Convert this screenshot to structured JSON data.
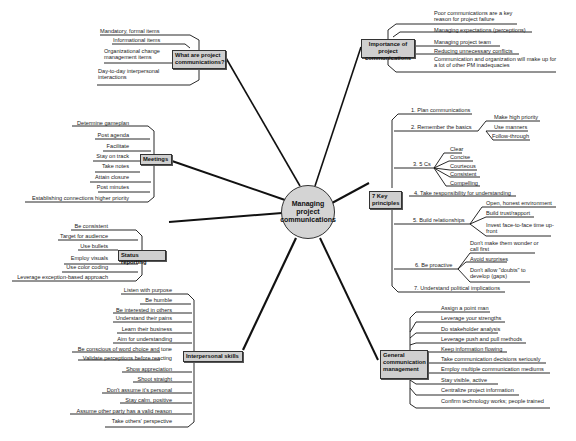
{
  "title": "Managing project communications",
  "colors": {
    "node_fill": "#cfcfcf",
    "center_fill": "#d4d4d4",
    "line": "#111111",
    "background": "#ffffff"
  },
  "branches": {
    "what": {
      "label": "What are project communications?",
      "items": [
        "Mandatory, formal items",
        "Informational items",
        "Organizational change management items",
        "Day-to-day interpersonal interactions"
      ]
    },
    "importance": {
      "label": "Importance of project communications",
      "items": [
        "Poor communications are a key reason for project failure",
        "Managing expectations (perceptions)",
        "Managing project team",
        "Reducing unnecessary conflicts",
        "Communication and organization will make up for a lot of other PM inadequacies"
      ]
    },
    "meetings": {
      "label": "Meetings",
      "items": [
        "Determine gameplan",
        "Post agenda",
        "Facilitate",
        "Stay on track",
        "Take notes",
        "Attain closure",
        "Post minutes",
        "Establishing connections higher priority"
      ]
    },
    "status": {
      "label": "Status reporting",
      "items": [
        "Be consistent",
        "Target for audience",
        "Use bullets",
        "Employ visuals",
        "Use color coding",
        "Leverage exception-based approach"
      ]
    },
    "interpersonal": {
      "label": "Interpersonal skills",
      "items": [
        "Listen with purpose",
        "Be humble",
        "Be interested in others",
        "Understand their pains",
        "Learn their business",
        "Aim for understanding",
        "Be conscious of word choice and tone",
        "Validate perceptions before reacting",
        "Show appreciation",
        "Shoot straight",
        "Don't assume it's personal",
        "Stay calm, positive",
        "Assume other party has a valid reason",
        "Take others' perspective"
      ]
    },
    "principles": {
      "label": "7 Key principles",
      "items": [
        {
          "label": "1. Plan communications",
          "children": []
        },
        {
          "label": "2. Remember the basics",
          "children": [
            "Make high priority",
            "Use manners",
            "Follow-through"
          ]
        },
        {
          "label": "3. 5 Cs",
          "children": [
            "Clear",
            "Concise",
            "Courteous",
            "Consistent",
            "Compelling"
          ]
        },
        {
          "label": "4. Take responsibility for understanding",
          "children": []
        },
        {
          "label": "5. Build relationships",
          "children": [
            "Open, honest environment",
            "Build trust/rapport",
            "Invest face-to-face time up-front"
          ]
        },
        {
          "label": "6. Be proactive",
          "children": [
            "Don't make them wonder or call first",
            "Avoid surprises",
            "Don't allow \"doubts\" to develop (gaps)"
          ]
        },
        {
          "label": "7. Understand political implications",
          "children": []
        }
      ]
    },
    "general": {
      "label": "General communication management",
      "items": [
        "Assign a point man",
        "Leverage your strengths",
        "Do stakeholder analysis",
        "Leverage push and pull methods",
        "Keep information flowing",
        "Take communication decisions seriously",
        "Employ multiple communication mediums",
        "Stay visible, active",
        "Centralize project information",
        "Confirm technology works; people trained"
      ]
    }
  }
}
